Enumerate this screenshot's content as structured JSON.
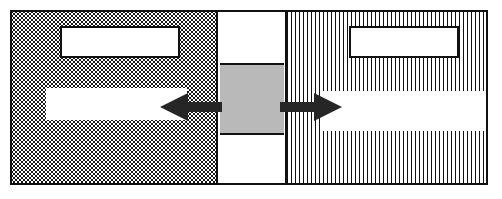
{
  "figure": {
    "title": "",
    "width": 502,
    "height": 199,
    "background": "#ffffff"
  },
  "colors": {
    "outline": "#111111",
    "core_fill": "#b9b9b9",
    "panel_fill": "#ffffff",
    "arrow_fill": "#262626"
  },
  "frame": {
    "label": "",
    "border_color": "#111111",
    "border_width": 2
  },
  "panels": {
    "left": {
      "label": "",
      "fill_pattern": "stipple-dots",
      "pattern_color": "#1a1a1a"
    },
    "center": {
      "label": "",
      "fill_pattern": "solid-white"
    },
    "right": {
      "label": "",
      "fill_pattern": "vertical-hatch",
      "pattern_color": "#111111"
    }
  },
  "core": {
    "label": "",
    "fill": "#b9b9b9",
    "outlined": true
  },
  "boxes": [
    {
      "name": "top-left-box",
      "label": "",
      "outlined": true,
      "panel": "left"
    },
    {
      "name": "top-right-box",
      "label": "",
      "outlined": true,
      "panel": "right"
    },
    {
      "name": "lower-left-band",
      "label": "",
      "outlined": false,
      "panel": "left"
    },
    {
      "name": "lower-right-band",
      "label": "",
      "outlined": false,
      "panel": "right"
    }
  ],
  "arrows": [
    {
      "name": "left-arrow",
      "label": "",
      "direction": "left",
      "fill": "#262626"
    },
    {
      "name": "right-arrow",
      "label": "",
      "direction": "right",
      "fill": "#262626"
    }
  ]
}
